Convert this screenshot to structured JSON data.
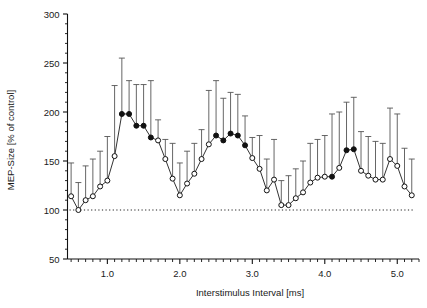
{
  "chart_data": {
    "type": "line",
    "title": "",
    "xlabel": "Interstimulus Interval [ms]",
    "ylabel": "MEP-Size [% of control]",
    "xlim": [
      0.45,
      5.3
    ],
    "ylim": [
      50,
      300
    ],
    "xticks_major": [
      1.0,
      2.0,
      3.0,
      4.0,
      5.0
    ],
    "xticklabels": [
      "1.0",
      "2.0",
      "3.0",
      "4.0",
      "5.0"
    ],
    "yticks_major": [
      50,
      100,
      150,
      200,
      250,
      300
    ],
    "yticklabels": [
      "50",
      "100",
      "150",
      "200",
      "250",
      "300"
    ],
    "yticks_minor": [
      60,
      70,
      80,
      90,
      110,
      120,
      130,
      140,
      160,
      170,
      180,
      190,
      210,
      220,
      230,
      240,
      260,
      270,
      280,
      290
    ],
    "xtick_minor_step": 0.1,
    "grid": false,
    "legend": null,
    "reference_line": {
      "y": 100,
      "style": "dotted",
      "label": "100% of control"
    },
    "marker_legend": {
      "filled": "significant (p<0.05)",
      "open": "not significant"
    },
    "series": [
      {
        "name": "MEP-Size",
        "x": [
          0.5,
          0.6,
          0.7,
          0.8,
          0.9,
          1.0,
          1.1,
          1.2,
          1.3,
          1.4,
          1.5,
          1.6,
          1.7,
          1.8,
          1.9,
          2.0,
          2.1,
          2.2,
          2.3,
          2.4,
          2.5,
          2.6,
          2.7,
          2.8,
          2.9,
          3.0,
          3.1,
          3.2,
          3.3,
          3.4,
          3.5,
          3.6,
          3.7,
          3.8,
          3.9,
          4.0,
          4.1,
          4.2,
          4.3,
          4.4,
          4.5,
          4.6,
          4.7,
          4.8,
          4.9,
          5.0,
          5.1,
          5.2
        ],
        "values": [
          114,
          100,
          110,
          114,
          124,
          130,
          155,
          198,
          198,
          186,
          186,
          174,
          171,
          152,
          132,
          115,
          127,
          137,
          152,
          167,
          176,
          171,
          178,
          176,
          166,
          153,
          142,
          120,
          131,
          105,
          105,
          112,
          118,
          128,
          133,
          134,
          134,
          143,
          161,
          162,
          140,
          135,
          131,
          131,
          152,
          145,
          124,
          115
        ],
        "err_upper": [
          148,
          128,
          145,
          152,
          160,
          175,
          227,
          255,
          232,
          228,
          228,
          232,
          192,
          172,
          168,
          148,
          160,
          168,
          182,
          222,
          232,
          214,
          220,
          218,
          196,
          174,
          176,
          152,
          172,
          130,
          135,
          142,
          150,
          168,
          172,
          176,
          198,
          200,
          210,
          215,
          180,
          175,
          170,
          168,
          204,
          198,
          163,
          152
        ],
        "significant": [
          false,
          false,
          false,
          false,
          false,
          false,
          false,
          true,
          true,
          true,
          true,
          true,
          false,
          false,
          false,
          false,
          false,
          false,
          false,
          false,
          true,
          true,
          true,
          true,
          true,
          false,
          false,
          false,
          false,
          false,
          false,
          false,
          false,
          false,
          false,
          false,
          true,
          false,
          true,
          true,
          false,
          false,
          false,
          false,
          false,
          false,
          false,
          false
        ],
        "marker_style": "circle",
        "line_color": "#333333",
        "error_bar_color": "#555555"
      }
    ]
  },
  "axis": {
    "x_label": "Interstimulus Interval [ms]",
    "y_label": "MEP-Size [% of control]"
  }
}
